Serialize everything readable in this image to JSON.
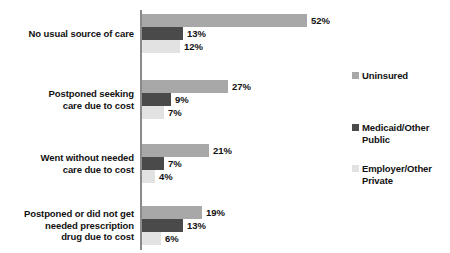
{
  "chart_data": {
    "type": "bar",
    "orientation": "horizontal",
    "title": "",
    "subtitle": "",
    "xlabel": "",
    "ylabel": "",
    "xlim": [
      0,
      52
    ],
    "grid": false,
    "legend_position": "right",
    "value_suffix": "%",
    "categories": [
      "No usual source of care",
      "Postponed seeking care due to cost",
      "Went without needed care due to cost",
      "Postponed or did not get needed prescription drug due to cost"
    ],
    "series": [
      {
        "name": "Uninsured",
        "color": "#a8a8a8",
        "values": [
          52,
          27,
          21,
          19
        ]
      },
      {
        "name": "Medicaid/Other Public",
        "color": "#4a4a4a",
        "values": [
          13,
          9,
          7,
          13
        ]
      },
      {
        "name": "Employer/Other Private",
        "color": "#e2e2e2",
        "values": [
          12,
          7,
          4,
          6
        ]
      }
    ]
  },
  "groups": [
    {
      "label_lines": [
        "No usual source of care"
      ],
      "bars": [
        {
          "series": "Uninsured",
          "value": 52,
          "value_label": "52%"
        },
        {
          "series": "Medicaid/Other Public",
          "value": 13,
          "value_label": "13%"
        },
        {
          "series": "Employer/Other Private",
          "value": 12,
          "value_label": "12%"
        }
      ]
    },
    {
      "label_lines": [
        "Postponed seeking",
        "care due to cost"
      ],
      "bars": [
        {
          "series": "Uninsured",
          "value": 27,
          "value_label": "27%"
        },
        {
          "series": "Medicaid/Other Public",
          "value": 9,
          "value_label": "9%"
        },
        {
          "series": "Employer/Other Private",
          "value": 7,
          "value_label": "7%"
        }
      ]
    },
    {
      "label_lines": [
        "Went without needed",
        "care due to cost"
      ],
      "bars": [
        {
          "series": "Uninsured",
          "value": 21,
          "value_label": "21%"
        },
        {
          "series": "Medicaid/Other Public",
          "value": 7,
          "value_label": "7%"
        },
        {
          "series": "Employer/Other Private",
          "value": 4,
          "value_label": "4%"
        }
      ]
    },
    {
      "label_lines": [
        "Postponed or did not get",
        "needed prescription",
        "drug due to cost"
      ],
      "bars": [
        {
          "series": "Uninsured",
          "value": 19,
          "value_label": "19%"
        },
        {
          "series": "Medicaid/Other Public",
          "value": 13,
          "value_label": "13%"
        },
        {
          "series": "Employer/Other Private",
          "value": 6,
          "value_label": "6%"
        }
      ]
    }
  ],
  "legend": {
    "items": [
      {
        "label": "Uninsured",
        "color": "#a8a8a8"
      },
      {
        "label": "Medicaid/Other Public",
        "color": "#4a4a4a"
      },
      {
        "label": "Employer/Other Private",
        "color": "#e2e2e2"
      }
    ]
  },
  "layout": {
    "group_tops": [
      14,
      80,
      144,
      206
    ],
    "legend_tops": [
      70,
      122,
      163
    ],
    "px_per_unit": 3.17,
    "axis_color": "#8a8a8a"
  }
}
